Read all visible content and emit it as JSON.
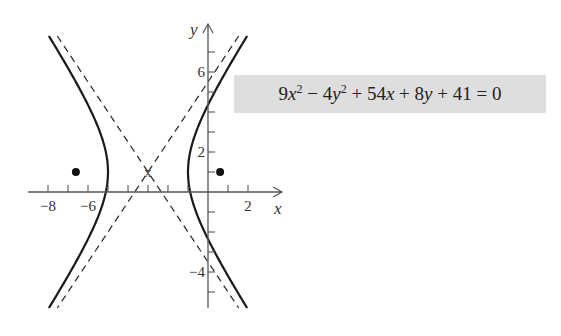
{
  "equation": {
    "text": "9x² − 4y² + 54x + 8y + 41 = 0",
    "parts": [
      "9",
      "x",
      "2",
      " − 4",
      "y",
      "2",
      " + 54",
      "x",
      " + 8",
      "y",
      " + 41 = 0"
    ]
  },
  "axes": {
    "x_label": "x",
    "y_label": "y",
    "x_tick_labels": [
      {
        "value": -8,
        "text": "−8"
      },
      {
        "value": -6,
        "text": "−6"
      },
      {
        "value": 2,
        "text": "2"
      }
    ],
    "y_tick_labels": [
      {
        "value": 6,
        "text": "6"
      },
      {
        "value": 2,
        "text": "2"
      },
      {
        "value": -4,
        "text": "−4"
      }
    ],
    "x_ticks": [
      -8,
      -7,
      -6,
      -5,
      -4,
      -3,
      -2,
      -1,
      1,
      2
    ],
    "y_ticks": [
      -5,
      -4,
      -3,
      -2,
      -1,
      1,
      2,
      3,
      4,
      5,
      6,
      7
    ],
    "x_range": [
      -9,
      3.7
    ],
    "y_range": [
      -5.8,
      8.4
    ]
  },
  "hyperbola": {
    "standard_form": "(x+3)²/4 − (y−1)²/9 = 1",
    "center": [
      -3,
      1
    ],
    "center_marker": "x",
    "a": 2,
    "b": 3,
    "vertices": [
      [
        -5,
        1
      ],
      [
        -1,
        1
      ]
    ],
    "foci": [
      [
        -6.606,
        1
      ],
      [
        0.606,
        1
      ]
    ],
    "asymptote_slopes": [
      1.5,
      -1.5
    ],
    "curve_color": "#1a1a1a",
    "asymptote_style": "dashed"
  }
}
